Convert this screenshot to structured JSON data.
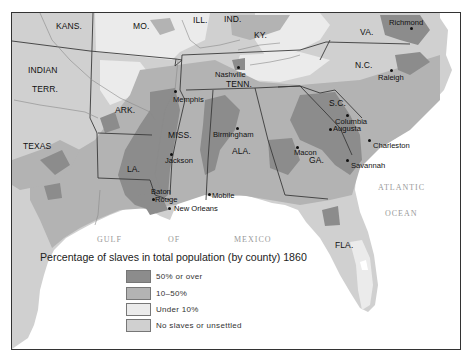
{
  "map": {
    "title": "Percentage of slaves in total population (by county) 1860",
    "colors": {
      "fifty_or_over": "#8c8c8c",
      "ten_to_fifty": "#b3b3b3",
      "under_ten": "#ebebeb",
      "no_slaves": "#d0d0d0",
      "water": "#ffffff",
      "border": "#3a3a3a"
    },
    "states": [
      {
        "id": "kans",
        "label": "KANS."
      },
      {
        "id": "mo",
        "label": "MO."
      },
      {
        "id": "ill",
        "label": "ILL."
      },
      {
        "id": "ind",
        "label": "IND."
      },
      {
        "id": "ky",
        "label": "KY."
      },
      {
        "id": "va",
        "label": "VA."
      },
      {
        "id": "indian-terr-1",
        "label": "INDIAN"
      },
      {
        "id": "indian-terr-2",
        "label": "TERR."
      },
      {
        "id": "tenn",
        "label": "TENN."
      },
      {
        "id": "nc",
        "label": "N.C."
      },
      {
        "id": "ark",
        "label": "ARK."
      },
      {
        "id": "sc",
        "label": "S.C."
      },
      {
        "id": "miss",
        "label": "MISS."
      },
      {
        "id": "texas",
        "label": "TEXAS"
      },
      {
        "id": "ala",
        "label": "ALA."
      },
      {
        "id": "ga",
        "label": "GA."
      },
      {
        "id": "la",
        "label": "LA."
      },
      {
        "id": "fla",
        "label": "FLA."
      }
    ],
    "cities": [
      {
        "id": "richmond",
        "label": "Richmond"
      },
      {
        "id": "raleigh",
        "label": "Raleigh"
      },
      {
        "id": "nashville",
        "label": "Nashville"
      },
      {
        "id": "memphis",
        "label": "Memphis"
      },
      {
        "id": "birmingham",
        "label": "Birmingham"
      },
      {
        "id": "columbia",
        "label": "Columbia"
      },
      {
        "id": "augusta",
        "label": "Augusta"
      },
      {
        "id": "charleston",
        "label": "Charleston"
      },
      {
        "id": "macon",
        "label": "Macon"
      },
      {
        "id": "savannah",
        "label": "Savannah"
      },
      {
        "id": "jackson",
        "label": "Jackson"
      },
      {
        "id": "baton-rouge-1",
        "label": "Baton"
      },
      {
        "id": "baton-rouge-2",
        "label": "Rouge"
      },
      {
        "id": "mobile",
        "label": "Mobile"
      },
      {
        "id": "new-orleans",
        "label": "New Orleans"
      }
    ],
    "rivers": [
      "Ohio",
      "Arkansas",
      "Red",
      "Cumberland",
      "Tennessee",
      "Mississippi",
      "Sabine"
    ],
    "water_bodies": [
      {
        "id": "gulf",
        "label": "GULF"
      },
      {
        "id": "of",
        "label": "OF"
      },
      {
        "id": "mexico",
        "label": "MEXICO"
      },
      {
        "id": "atlantic",
        "label": "ATLANTIC"
      },
      {
        "id": "ocean",
        "label": "OCEAN"
      }
    ]
  },
  "legend": {
    "title": "Percentage of slaves in total population (by county) 1860",
    "items": [
      {
        "label": "50% or over",
        "color": "#8c8c8c"
      },
      {
        "label": "10–50%",
        "color": "#b3b3b3"
      },
      {
        "label": "Under 10%",
        "color": "#ebebeb"
      },
      {
        "label": "No slaves or unsettled",
        "color": "#d0d0d0"
      }
    ]
  }
}
